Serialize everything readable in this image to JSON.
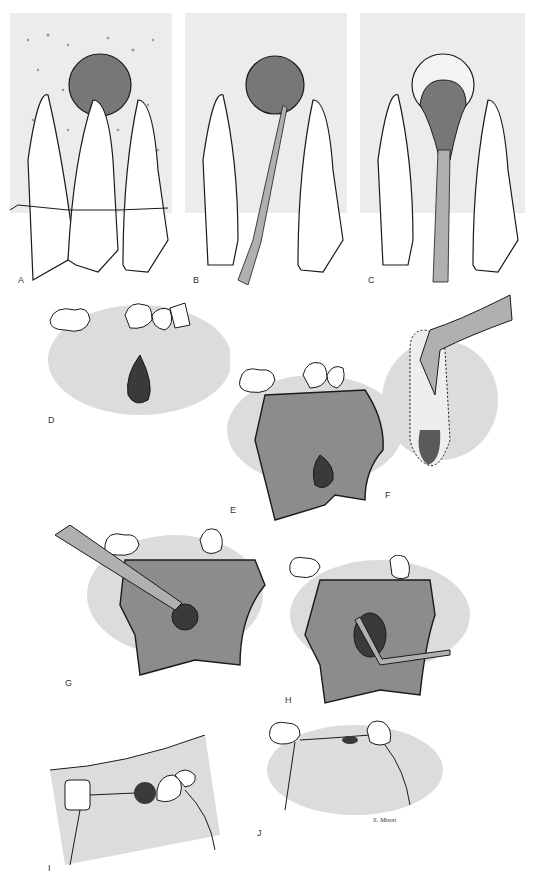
{
  "figure": {
    "panels": [
      {
        "id": "A",
        "label": "A",
        "description": "Cyst at apex between central incisor roots, in alveolar bone"
      },
      {
        "id": "B",
        "label": "B",
        "description": "Curette/elevator instrument inserted toward cyst"
      },
      {
        "id": "C",
        "label": "C",
        "description": "Cyst lining being enucleated with instrument"
      },
      {
        "id": "D",
        "label": "D",
        "description": "Dark lesion below premolars in gingiva"
      },
      {
        "id": "E",
        "label": "E",
        "description": "Mucoperiosteal flap raised, lesion exposed"
      },
      {
        "id": "F",
        "label": "F",
        "description": "Extraction forceps on tooth with apical lesion"
      },
      {
        "id": "G",
        "label": "G",
        "description": "Bur removing bone over lesion"
      },
      {
        "id": "H",
        "label": "H",
        "description": "Curette enucleating lesion through bony window"
      },
      {
        "id": "I",
        "label": "I",
        "description": "Occlusal view with sutures over defect"
      },
      {
        "id": "J",
        "label": "J",
        "description": "Flap repositioned and sutured"
      }
    ],
    "signature": "S. Moon"
  },
  "colors": {
    "bone_stipple": "#e8e8e8",
    "lesion": "#5a5a5a",
    "lesion_dark": "#3a3a3a",
    "flap": "#8c8c8c",
    "gingiva": "#dcdcdc",
    "instrument": "#b0b0b0",
    "outline": "#1a1a1a"
  }
}
